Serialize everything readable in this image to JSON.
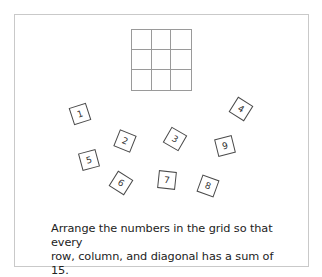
{
  "puzzle": {
    "title": "Magic square puzzle",
    "grid": {
      "rows": 3,
      "cols": 3,
      "cells": [
        [
          "",
          "",
          ""
        ],
        [
          "",
          "",
          ""
        ],
        [
          "",
          "",
          ""
        ]
      ]
    },
    "tiles": [
      {
        "label": "1",
        "x": 71,
        "y": 105,
        "rotate": -18
      },
      {
        "label": "2",
        "x": 116,
        "y": 132,
        "rotate": 22
      },
      {
        "label": "3",
        "x": 166,
        "y": 130,
        "rotate": 30
      },
      {
        "label": "4",
        "x": 232,
        "y": 100,
        "rotate": 32
      },
      {
        "label": "5",
        "x": 80,
        "y": 151,
        "rotate": -15
      },
      {
        "label": "6",
        "x": 112,
        "y": 174,
        "rotate": 32
      },
      {
        "label": "7",
        "x": 158,
        "y": 171,
        "rotate": 6
      },
      {
        "label": "8",
        "x": 199,
        "y": 177,
        "rotate": 20
      },
      {
        "label": "9",
        "x": 216,
        "y": 137,
        "rotate": -14
      }
    ],
    "instructions_line1": "Arrange the numbers in the grid so that every",
    "instructions_line2": "row, column, and diagonal has a sum of 15.",
    "target_sum": 15
  },
  "colors": {
    "frame_border": "#c9c9c9",
    "grid_line": "#9a9a9a",
    "tile_border": "#4a4a4a",
    "text": "#222222"
  }
}
